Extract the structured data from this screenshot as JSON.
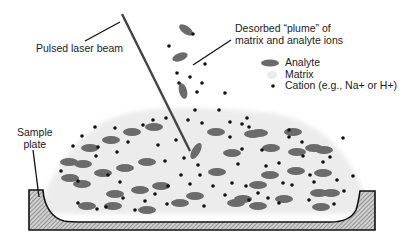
{
  "diagram": {
    "labels": {
      "laser": "Pulsed laser beam",
      "plume_line1": "Desorbed “plume” of",
      "plume_line2": "matrix and analyte ions",
      "plate_line1": "Sample",
      "plate_line2": "plate"
    },
    "legend": [
      {
        "symbol": "analyte-ellipse",
        "label": "Analyte"
      },
      {
        "symbol": "matrix-blob",
        "label": "Matrix"
      },
      {
        "symbol": "cation-dot",
        "label": "Cation (e.g., Na+ or H+)"
      }
    ],
    "colors": {
      "analyte": "#6b6b6b",
      "matrix": "#ececec",
      "cation": "#111111",
      "plate_fill": "#bdbdbd",
      "plate_stroke": "#111111",
      "laser": "#444444",
      "text": "#1a1a1a"
    },
    "analytes": [
      [
        90,
        148,
        9,
        4,
        0
      ],
      [
        111,
        140,
        9,
        4,
        0
      ],
      [
        132,
        132,
        9,
        4,
        0
      ],
      [
        154,
        127,
        9,
        4,
        0
      ],
      [
        83,
        164,
        9,
        4,
        0
      ],
      [
        103,
        173,
        9,
        4,
        0
      ],
      [
        125,
        168,
        9,
        4,
        0
      ],
      [
        147,
        162,
        9,
        4,
        0
      ],
      [
        82,
        184,
        9,
        4,
        0
      ],
      [
        115,
        194,
        9,
        4,
        0
      ],
      [
        140,
        190,
        9,
        4,
        0
      ],
      [
        161,
        186,
        9,
        4,
        0
      ],
      [
        87,
        206,
        9,
        4,
        0
      ],
      [
        113,
        206,
        9,
        4,
        0
      ],
      [
        147,
        210,
        9,
        4,
        0
      ],
      [
        180,
        203,
        9,
        4,
        0
      ],
      [
        69,
        162,
        9,
        4,
        0
      ],
      [
        70,
        178,
        9,
        4,
        0
      ],
      [
        216,
        132,
        9,
        4,
        0
      ],
      [
        232,
        153,
        9,
        4,
        0
      ],
      [
        217,
        172,
        9,
        4,
        0
      ],
      [
        195,
        196,
        9,
        4,
        0
      ],
      [
        236,
        203,
        9,
        4,
        0
      ],
      [
        258,
        185,
        9,
        4,
        0
      ],
      [
        258,
        206,
        9,
        4,
        0
      ],
      [
        259,
        133,
        9,
        4,
        0
      ],
      [
        271,
        148,
        9,
        4,
        0
      ],
      [
        293,
        132,
        9,
        4,
        0
      ],
      [
        297,
        152,
        9,
        4,
        0
      ],
      [
        314,
        148,
        9,
        4,
        0
      ],
      [
        324,
        150,
        9,
        4,
        0
      ],
      [
        323,
        173,
        9,
        4,
        0
      ],
      [
        296,
        171,
        9,
        4,
        0
      ],
      [
        270,
        175,
        9,
        4,
        0
      ],
      [
        319,
        193,
        9,
        4,
        0
      ],
      [
        331,
        193,
        9,
        4,
        0
      ],
      [
        243,
        199,
        9,
        4,
        0
      ],
      [
        284,
        199,
        9,
        4,
        0
      ],
      [
        321,
        207,
        9,
        4,
        0
      ],
      [
        253,
        134,
        9,
        4,
        0
      ],
      [
        196,
        151,
        9,
        4,
        -60
      ],
      [
        186,
        30,
        8,
        4,
        35
      ],
      [
        180,
        57,
        8,
        4,
        -20
      ],
      [
        183,
        91,
        8,
        4,
        75
      ]
    ],
    "cations": [
      [
        95,
        127
      ],
      [
        115,
        128
      ],
      [
        143,
        125
      ],
      [
        153,
        120
      ],
      [
        73,
        146
      ],
      [
        82,
        136
      ],
      [
        98,
        147
      ],
      [
        117,
        152
      ],
      [
        96,
        156
      ],
      [
        108,
        175
      ],
      [
        128,
        142
      ],
      [
        61,
        171
      ],
      [
        78,
        181
      ],
      [
        120,
        182
      ],
      [
        123,
        198
      ],
      [
        78,
        203
      ],
      [
        97,
        209
      ],
      [
        106,
        207
      ],
      [
        135,
        210
      ],
      [
        145,
        201
      ],
      [
        155,
        194
      ],
      [
        167,
        204
      ],
      [
        168,
        186
      ],
      [
        181,
        175
      ],
      [
        184,
        158
      ],
      [
        165,
        161
      ],
      [
        158,
        145
      ],
      [
        176,
        140
      ],
      [
        198,
        165
      ],
      [
        200,
        175
      ],
      [
        190,
        184
      ],
      [
        213,
        186
      ],
      [
        204,
        206
      ],
      [
        225,
        195
      ],
      [
        232,
        183
      ],
      [
        246,
        186
      ],
      [
        249,
        200
      ],
      [
        258,
        193
      ],
      [
        268,
        198
      ],
      [
        279,
        203
      ],
      [
        283,
        183
      ],
      [
        292,
        185
      ],
      [
        279,
        163
      ],
      [
        266,
        166
      ],
      [
        262,
        150
      ],
      [
        242,
        149
      ],
      [
        238,
        164
      ],
      [
        230,
        137
      ],
      [
        249,
        127
      ],
      [
        247,
        118
      ],
      [
        242,
        124
      ],
      [
        289,
        130
      ],
      [
        289,
        137
      ],
      [
        302,
        142
      ],
      [
        303,
        156
      ],
      [
        314,
        182
      ],
      [
        310,
        175
      ],
      [
        323,
        162
      ],
      [
        330,
        157
      ],
      [
        337,
        180
      ],
      [
        344,
        191
      ],
      [
        309,
        200
      ],
      [
        343,
        138
      ],
      [
        353,
        176
      ],
      [
        334,
        204
      ],
      [
        230,
        122
      ],
      [
        202,
        123
      ],
      [
        188,
        120
      ],
      [
        193,
        34
      ],
      [
        169,
        46
      ],
      [
        190,
        77
      ],
      [
        177,
        73
      ],
      [
        205,
        64
      ],
      [
        179,
        83
      ],
      [
        202,
        83
      ],
      [
        197,
        92
      ],
      [
        195,
        110
      ],
      [
        219,
        110
      ],
      [
        166,
        118
      ],
      [
        225,
        93
      ]
    ]
  }
}
